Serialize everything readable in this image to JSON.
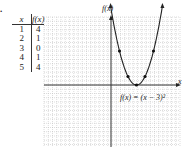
{
  "problem_number": ".",
  "table": {
    "headers": [
      "x",
      "f(x)"
    ],
    "rows": [
      {
        "x": "1",
        "fx": "4"
      },
      {
        "x": "2",
        "fx": "1"
      },
      {
        "x": "3",
        "fx": "0"
      },
      {
        "x": "4",
        "fx": "1"
      },
      {
        "x": "5",
        "fx": "4"
      }
    ]
  },
  "graph": {
    "y_axis_label": "f(x)",
    "x_axis_label": "x",
    "equation_label": "f(x) = (x − 3)²"
  },
  "chart_data": {
    "type": "line",
    "title": "",
    "xlabel": "x",
    "ylabel": "f(x)",
    "function": "f(x) = (x - 3)^2",
    "x": [
      1,
      2,
      3,
      4,
      5
    ],
    "values": [
      4,
      1,
      0,
      1,
      4
    ],
    "points": [
      [
        1,
        4
      ],
      [
        2,
        1
      ],
      [
        3,
        0
      ],
      [
        4,
        1
      ],
      [
        5,
        4
      ]
    ],
    "xlim": [
      -8,
      8
    ],
    "ylim": [
      -7,
      8
    ],
    "grid": true,
    "legend": "none",
    "annotations": [
      "f(x) = (x − 3)²"
    ]
  }
}
